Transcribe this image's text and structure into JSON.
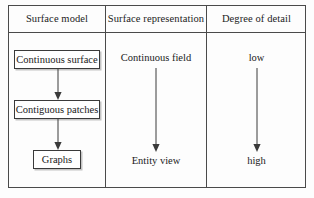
{
  "figure": {
    "kind": "three-column-comparison-table",
    "columns": [
      {
        "header": "Surface model",
        "nodes": [
          {
            "label": "Continuous surface",
            "style": "boxed"
          },
          {
            "label": "Contiguous patches",
            "style": "boxed"
          },
          {
            "label": "Graphs",
            "style": "boxed"
          }
        ],
        "arrows": [
          {
            "from": "Continuous surface",
            "to": "Contiguous patches",
            "direction": "down"
          },
          {
            "from": "Contiguous patches",
            "to": "Graphs",
            "direction": "down"
          }
        ]
      },
      {
        "header": "Surface representation",
        "nodes": [
          {
            "label": "Continuous field",
            "style": "plain"
          },
          {
            "label": "Entity view",
            "style": "plain"
          }
        ],
        "arrows": [
          {
            "from": "Continuous field",
            "to": "Entity view",
            "direction": "down"
          }
        ]
      },
      {
        "header": "Degree of detail",
        "nodes": [
          {
            "label": "low",
            "style": "plain"
          },
          {
            "label": "high",
            "style": "plain"
          }
        ],
        "arrows": [
          {
            "from": "low",
            "to": "high",
            "direction": "down"
          }
        ]
      }
    ]
  },
  "colors": {
    "background": "#fdfdfd",
    "frame_border": "#4a4a4a",
    "node_border": "#3a3a3a",
    "arrow": "#3a3a3a",
    "text": "#1a1a1a"
  }
}
